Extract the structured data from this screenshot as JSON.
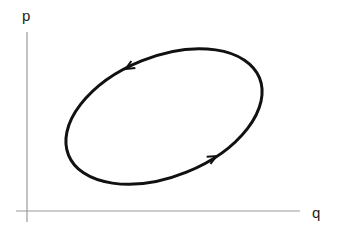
{
  "diagram": {
    "type": "phase-space-orbit",
    "axes": {
      "x_label": "q",
      "y_label": "p",
      "color": "#999999"
    },
    "orbit": {
      "shape": "ellipse",
      "direction": "counterclockwise",
      "stroke_color": "#111111",
      "arrows": [
        {
          "position": "top-left",
          "pointing": "down-left"
        },
        {
          "position": "bottom-right",
          "pointing": "up-right"
        }
      ]
    }
  }
}
